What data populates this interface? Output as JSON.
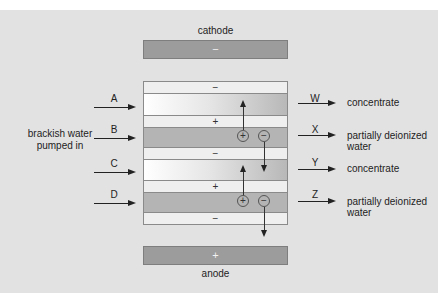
{
  "diagram": {
    "cathode": {
      "label": "cathode",
      "sign": "−"
    },
    "anode": {
      "label": "anode",
      "sign": "+"
    },
    "inlet_label": "brackish water pumped in",
    "inlet_label_lines": [
      "brackish water",
      "pumped in"
    ],
    "membranes": [
      {
        "sign": "−"
      },
      {
        "sign": "+"
      },
      {
        "sign": "−"
      },
      {
        "sign": "+"
      },
      {
        "sign": "−"
      }
    ],
    "inlets": [
      "A",
      "B",
      "C",
      "D"
    ],
    "outlets": [
      {
        "letter": "W",
        "lines": [
          "concentrate"
        ]
      },
      {
        "letter": "X",
        "lines": [
          "partially deionized",
          "water"
        ]
      },
      {
        "letter": "Y",
        "lines": [
          "concentrate"
        ]
      },
      {
        "letter": "Z",
        "lines": [
          "partially deionized",
          "water"
        ]
      }
    ],
    "ions": [
      {
        "sign": "+",
        "direction": "up"
      },
      {
        "sign": "−",
        "direction": "down"
      },
      {
        "sign": "+",
        "direction": "up"
      },
      {
        "sign": "−",
        "direction": "down"
      }
    ],
    "colors": {
      "background": "#e2e2e2",
      "electrode": "#9c9c9c",
      "membrane": "#efefef",
      "dilute_channel": "#b4b4b4"
    }
  }
}
